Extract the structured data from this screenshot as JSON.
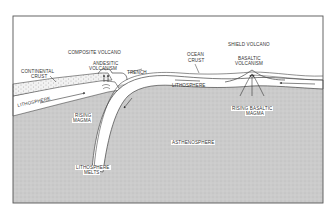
{
  "diagram": {
    "colors": {
      "frame": "#555555",
      "asthenosphere": "#c9c9c9",
      "lithosphere": "#ffffff",
      "continental_crust": "#e6e6e6",
      "line": "#444444"
    },
    "labels": {
      "composite_volcano": "COMPOSITE VOLCANO",
      "andesitic_volcanism_1": "ANDESITIC",
      "andesitic_volcanism_2": "VOLCANISM",
      "trench": "TRENCH",
      "continental_crust_1": "CONTINENTAL",
      "continental_crust_2": "CRUST",
      "lithosphere_left": "LITHOSPHERE",
      "rising_magma_1": "RISING",
      "rising_magma_2": "MAGMA",
      "lithosphere_melts_1": "LITHOSPHERE",
      "lithosphere_melts_2": "MELTS",
      "ocean_crust_1": "OCEAN",
      "ocean_crust_2": "CRUST",
      "lithosphere_center": "LITHOSPHERE",
      "shield_volcano": "SHIELD VOLCANO",
      "basaltic_volcanism_1": "BASALTIC",
      "basaltic_volcanism_2": "VOLCANISM",
      "rising_basaltic_magma_1": "RISING BASALTIC",
      "rising_basaltic_magma_2": "MAGMA",
      "asthenosphere": "ASTHENOSPHERE"
    }
  }
}
